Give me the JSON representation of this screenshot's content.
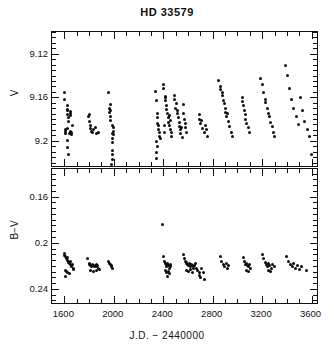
{
  "title": "HD 33579",
  "axis": {
    "x_label": "J.D.  −  2440000",
    "x_ticks": [
      "1600",
      "2000",
      "2400",
      "2800",
      "3200",
      "3600"
    ],
    "x_tick_values": [
      1600,
      2000,
      2400,
      2800,
      3200,
      3600
    ],
    "x_range": [
      1500,
      3660
    ],
    "v_label": "V",
    "v_ticks": [
      "9.12",
      "9.16",
      "9.2"
    ],
    "v_tick_values": [
      9.12,
      9.16,
      9.2
    ],
    "v_range": [
      9.1,
      9.225
    ],
    "bv_label": "B−V",
    "bv_ticks": [
      "0.16",
      "0.2",
      "0.24"
    ],
    "bv_tick_values": [
      0.16,
      0.2,
      0.24
    ],
    "bv_range": [
      0.136,
      0.254
    ]
  },
  "chart_data": {
    "type": "scatter",
    "title": "HD 33579",
    "xlabel": "J.D.  −  2440000",
    "grid": false,
    "legend": "none",
    "panels": [
      {
        "name": "V-magnitude-panel",
        "ylabel": "V",
        "ylim": [
          9.1,
          9.225
        ],
        "y_inverted": true,
        "xlim": [
          1500,
          3660
        ],
        "points": [
          [
            1603,
            9.156
          ],
          [
            1604,
            9.162
          ],
          [
            1622,
            9.168
          ],
          [
            1624,
            9.172
          ],
          [
            1626,
            9.171
          ],
          [
            1628,
            9.176
          ],
          [
            1631,
            9.179
          ],
          [
            1634,
            9.182
          ],
          [
            1648,
            9.173
          ],
          [
            1650,
            9.177
          ],
          [
            1652,
            9.175
          ],
          [
            1664,
            9.186
          ],
          [
            1623,
            9.189
          ],
          [
            1608,
            9.19
          ],
          [
            1610,
            9.193
          ],
          [
            1612,
            9.191
          ],
          [
            1640,
            9.193
          ],
          [
            1646,
            9.191
          ],
          [
            1654,
            9.192
          ],
          [
            1660,
            9.194
          ],
          [
            1628,
            9.2
          ],
          [
            1629,
            9.206
          ],
          [
            1630,
            9.213
          ],
          [
            1797,
            9.178
          ],
          [
            1800,
            9.182
          ],
          [
            1802,
            9.176
          ],
          [
            1812,
            9.186
          ],
          [
            1815,
            9.189
          ],
          [
            1822,
            9.191
          ],
          [
            1826,
            9.192
          ],
          [
            1832,
            9.19
          ],
          [
            1852,
            9.188
          ],
          [
            1858,
            9.193
          ],
          [
            1878,
            9.192
          ],
          [
            1953,
            9.156
          ],
          [
            1966,
            9.17
          ],
          [
            1968,
            9.174
          ],
          [
            1970,
            9.167
          ],
          [
            1972,
            9.178
          ],
          [
            1974,
            9.181
          ],
          [
            1976,
            9.172
          ],
          [
            1992,
            9.186
          ],
          [
            1996,
            9.191
          ],
          [
            1999,
            9.188
          ],
          [
            1993,
            9.193
          ],
          [
            1997,
            9.194
          ],
          [
            1988,
            9.198
          ],
          [
            1990,
            9.202
          ],
          [
            1986,
            9.209
          ],
          [
            1987,
            9.213
          ],
          [
            1988,
            9.217
          ],
          [
            1985,
            9.222
          ],
          [
            2335,
            9.155
          ],
          [
            2345,
            9.163
          ],
          [
            2352,
            9.175
          ],
          [
            2354,
            9.179
          ],
          [
            2356,
            9.184
          ],
          [
            2358,
            9.186
          ],
          [
            2362,
            9.19
          ],
          [
            2366,
            9.192
          ],
          [
            2372,
            9.196
          ],
          [
            2375,
            9.198
          ],
          [
            2348,
            9.201
          ],
          [
            2350,
            9.205
          ],
          [
            2346,
            9.211
          ],
          [
            2344,
            9.216
          ],
          [
            2398,
            9.148
          ],
          [
            2404,
            9.152
          ],
          [
            2418,
            9.16
          ],
          [
            2420,
            9.163
          ],
          [
            2422,
            9.159
          ],
          [
            2428,
            9.168
          ],
          [
            2430,
            9.171
          ],
          [
            2436,
            9.175
          ],
          [
            2440,
            9.179
          ],
          [
            2444,
            9.183
          ],
          [
            2448,
            9.186
          ],
          [
            2452,
            9.177
          ],
          [
            2455,
            9.181
          ],
          [
            2460,
            9.19
          ],
          [
            2464,
            9.192
          ],
          [
            2470,
            9.196
          ],
          [
            2412,
            9.186
          ],
          [
            2414,
            9.192
          ],
          [
            2490,
            9.158
          ],
          [
            2493,
            9.162
          ],
          [
            2500,
            9.17
          ],
          [
            2504,
            9.166
          ],
          [
            2512,
            9.175
          ],
          [
            2516,
            9.172
          ],
          [
            2524,
            9.179
          ],
          [
            2528,
            9.183
          ],
          [
            2532,
            9.187
          ],
          [
            2536,
            9.19
          ],
          [
            2540,
            9.193
          ],
          [
            2544,
            9.188
          ],
          [
            2552,
            9.197
          ],
          [
            2560,
            9.167
          ],
          [
            2566,
            9.175
          ],
          [
            2570,
            9.18
          ],
          [
            2578,
            9.184
          ],
          [
            2582,
            9.188
          ],
          [
            2590,
            9.192
          ],
          [
            2692,
            9.176
          ],
          [
            2696,
            9.18
          ],
          [
            2704,
            9.184
          ],
          [
            2708,
            9.181
          ],
          [
            2716,
            9.189
          ],
          [
            2730,
            9.192
          ],
          [
            2742,
            9.186
          ],
          [
            2746,
            9.19
          ],
          [
            2760,
            9.196
          ],
          [
            2850,
            9.145
          ],
          [
            2862,
            9.15
          ],
          [
            2866,
            9.153
          ],
          [
            2876,
            9.158
          ],
          [
            2880,
            9.156
          ],
          [
            2888,
            9.163
          ],
          [
            2892,
            9.166
          ],
          [
            2900,
            9.17
          ],
          [
            2904,
            9.174
          ],
          [
            2912,
            9.178
          ],
          [
            2916,
            9.175
          ],
          [
            2926,
            9.182
          ],
          [
            2938,
            9.187
          ],
          [
            2950,
            9.192
          ],
          [
            2960,
            9.196
          ],
          [
            3040,
            9.16
          ],
          [
            3044,
            9.164
          ],
          [
            3052,
            9.168
          ],
          [
            3056,
            9.172
          ],
          [
            3064,
            9.176
          ],
          [
            3068,
            9.18
          ],
          [
            3076,
            9.184
          ],
          [
            3088,
            9.188
          ],
          [
            3100,
            9.192
          ],
          [
            3190,
            9.143
          ],
          [
            3200,
            9.148
          ],
          [
            3212,
            9.156
          ],
          [
            3224,
            9.162
          ],
          [
            3228,
            9.165
          ],
          [
            3240,
            9.17
          ],
          [
            3252,
            9.175
          ],
          [
            3256,
            9.178
          ],
          [
            3268,
            9.183
          ],
          [
            3280,
            9.187
          ],
          [
            3292,
            9.192
          ],
          [
            3304,
            9.196
          ],
          [
            3390,
            9.131
          ],
          [
            3402,
            9.14
          ],
          [
            3420,
            9.152
          ],
          [
            3438,
            9.162
          ],
          [
            3456,
            9.17
          ],
          [
            3474,
            9.178
          ],
          [
            3492,
            9.185
          ],
          [
            3510,
            9.16
          ],
          [
            3528,
            9.172
          ],
          [
            3546,
            9.182
          ],
          [
            3564,
            9.19
          ],
          [
            3582,
            9.196
          ],
          [
            3600,
            9.213
          ]
        ]
      },
      {
        "name": "B-minus-V-panel",
        "ylabel": "B−V",
        "ylim": [
          0.136,
          0.254
        ],
        "y_inverted": true,
        "xlim": [
          1500,
          3660
        ],
        "points": [
          [
            1600,
            0.209
          ],
          [
            1604,
            0.211
          ],
          [
            1612,
            0.212
          ],
          [
            1616,
            0.214
          ],
          [
            1622,
            0.213
          ],
          [
            1626,
            0.215
          ],
          [
            1630,
            0.216
          ],
          [
            1636,
            0.217
          ],
          [
            1640,
            0.218
          ],
          [
            1646,
            0.216
          ],
          [
            1650,
            0.219
          ],
          [
            1656,
            0.22
          ],
          [
            1660,
            0.221
          ],
          [
            1666,
            0.219
          ],
          [
            1670,
            0.222
          ],
          [
            1676,
            0.223
          ],
          [
            1610,
            0.224
          ],
          [
            1618,
            0.225
          ],
          [
            1628,
            0.226
          ],
          [
            1640,
            0.227
          ],
          [
            1608,
            0.229
          ],
          [
            1790,
            0.214
          ],
          [
            1800,
            0.218
          ],
          [
            1806,
            0.219
          ],
          [
            1814,
            0.22
          ],
          [
            1820,
            0.221
          ],
          [
            1828,
            0.219
          ],
          [
            1834,
            0.22
          ],
          [
            1842,
            0.221
          ],
          [
            1848,
            0.22
          ],
          [
            1856,
            0.219
          ],
          [
            1862,
            0.221
          ],
          [
            1870,
            0.22
          ],
          [
            1878,
            0.222
          ],
          [
            1886,
            0.223
          ],
          [
            1810,
            0.224
          ],
          [
            1836,
            0.225
          ],
          [
            1862,
            0.224
          ],
          [
            1960,
            0.216
          ],
          [
            1964,
            0.218
          ],
          [
            1972,
            0.219
          ],
          [
            1978,
            0.221
          ],
          [
            1984,
            0.22
          ],
          [
            1992,
            0.222
          ],
          [
            2390,
            0.184
          ],
          [
            2400,
            0.212
          ],
          [
            2412,
            0.216
          ],
          [
            2416,
            0.218
          ],
          [
            2424,
            0.219
          ],
          [
            2430,
            0.221
          ],
          [
            2436,
            0.218
          ],
          [
            2442,
            0.22
          ],
          [
            2450,
            0.222
          ],
          [
            2456,
            0.221
          ],
          [
            2462,
            0.219
          ],
          [
            2418,
            0.224
          ],
          [
            2428,
            0.226
          ],
          [
            2440,
            0.225
          ],
          [
            2452,
            0.227
          ],
          [
            2432,
            0.229
          ],
          [
            2560,
            0.21
          ],
          [
            2572,
            0.214
          ],
          [
            2578,
            0.216
          ],
          [
            2586,
            0.218
          ],
          [
            2592,
            0.217
          ],
          [
            2600,
            0.219
          ],
          [
            2606,
            0.22
          ],
          [
            2614,
            0.218
          ],
          [
            2620,
            0.221
          ],
          [
            2628,
            0.219
          ],
          [
            2634,
            0.22
          ],
          [
            2642,
            0.222
          ],
          [
            2648,
            0.221
          ],
          [
            2656,
            0.22
          ],
          [
            2590,
            0.224
          ],
          [
            2604,
            0.225
          ],
          [
            2620,
            0.223
          ],
          [
            2636,
            0.226
          ],
          [
            2660,
            0.218
          ],
          [
            2672,
            0.222
          ],
          [
            2680,
            0.224
          ],
          [
            2690,
            0.228
          ],
          [
            2696,
            0.226
          ],
          [
            2704,
            0.23
          ],
          [
            2712,
            0.222
          ],
          [
            2722,
            0.226
          ],
          [
            2734,
            0.232
          ],
          [
            2860,
            0.212
          ],
          [
            2872,
            0.216
          ],
          [
            2884,
            0.219
          ],
          [
            2896,
            0.221
          ],
          [
            2908,
            0.218
          ],
          [
            2920,
            0.222
          ],
          [
            2930,
            0.22
          ],
          [
            3050,
            0.213
          ],
          [
            3056,
            0.216
          ],
          [
            3066,
            0.219
          ],
          [
            3072,
            0.218
          ],
          [
            3082,
            0.22
          ],
          [
            3088,
            0.221
          ],
          [
            3098,
            0.219
          ],
          [
            3108,
            0.222
          ],
          [
            3070,
            0.224
          ],
          [
            3090,
            0.225
          ],
          [
            3200,
            0.21
          ],
          [
            3212,
            0.214
          ],
          [
            3224,
            0.217
          ],
          [
            3236,
            0.219
          ],
          [
            3242,
            0.221
          ],
          [
            3254,
            0.218
          ],
          [
            3260,
            0.22
          ],
          [
            3272,
            0.222
          ],
          [
            3284,
            0.219
          ],
          [
            3296,
            0.221
          ],
          [
            3250,
            0.224
          ],
          [
            3268,
            0.225
          ],
          [
            3400,
            0.212
          ],
          [
            3414,
            0.216
          ],
          [
            3428,
            0.219
          ],
          [
            3442,
            0.221
          ],
          [
            3456,
            0.218
          ],
          [
            3470,
            0.222
          ],
          [
            3484,
            0.22
          ],
          [
            3500,
            0.223
          ],
          [
            3520,
            0.221
          ],
          [
            3560,
            0.224
          ]
        ]
      }
    ]
  }
}
